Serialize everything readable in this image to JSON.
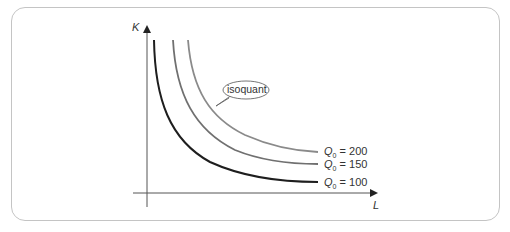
{
  "diagram": {
    "type": "isoquant map",
    "y_axis_label": "K",
    "x_axis_label": "L",
    "callout_label": "isoquant",
    "curves": [
      {
        "label_var": "Q",
        "label_sub": "0",
        "value": "200",
        "color": "#8a8a8a"
      },
      {
        "label_var": "Q",
        "label_sub": "0",
        "value": "150",
        "color": "#6f6f6f"
      },
      {
        "label_var": "Q",
        "label_sub": "0",
        "value": "100",
        "color": "#1e1e1e"
      }
    ],
    "eq_sign": "="
  }
}
